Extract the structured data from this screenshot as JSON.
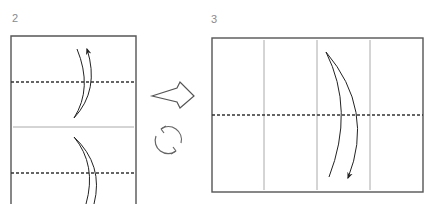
{
  "diagram": {
    "type": "origami-folding-instructions",
    "steps": [
      {
        "number": "2",
        "paper": "vertical rectangle (cropped at bottom)",
        "lines": [
          {
            "kind": "valley-fold-dashed",
            "orientation": "horizontal",
            "position": "upper"
          },
          {
            "kind": "crease-solid",
            "orientation": "horizontal",
            "position": "middle"
          },
          {
            "kind": "valley-fold-dashed",
            "orientation": "horizontal",
            "position": "lower"
          }
        ],
        "arrows": [
          {
            "kind": "fold-arrow",
            "direction": "up"
          },
          {
            "kind": "fold-arrow",
            "direction": "down"
          }
        ]
      },
      {
        "number": "3",
        "paper": "horizontal rectangle",
        "lines": [
          {
            "kind": "crease-solid",
            "orientation": "vertical",
            "count": 3
          },
          {
            "kind": "valley-fold-dashed",
            "orientation": "horizontal",
            "position": "middle"
          }
        ],
        "arrows": [
          {
            "kind": "fold-arrow",
            "direction": "down"
          }
        ]
      }
    ],
    "transition": {
      "next_icon": "hollow-right-arrow-icon",
      "rotate_icon": "rotate-icon"
    },
    "colors": {
      "outline": "#555555",
      "crease": "#999999",
      "dashed": "#333333",
      "arrow": "#222222",
      "label": "#8a8a8a"
    }
  }
}
